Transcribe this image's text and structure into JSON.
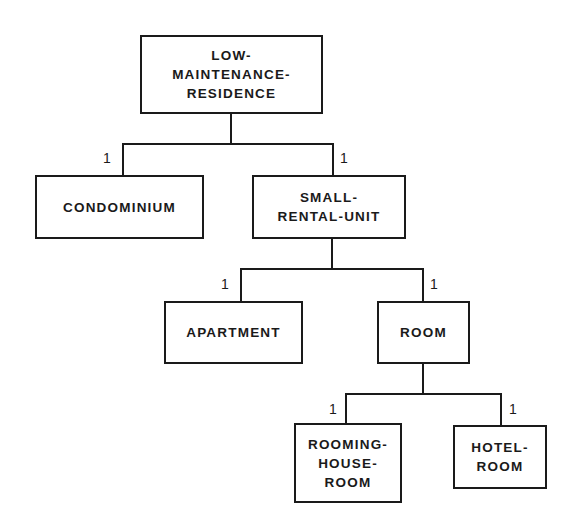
{
  "diagram": {
    "type": "generalization hierarchy",
    "nodes": [
      {
        "id": "low-maintenance-residence",
        "label": "LOW-\nMAINTENANCE-\nRESIDENCE"
      },
      {
        "id": "condominium",
        "label": "CONDOMINIUM"
      },
      {
        "id": "small-rental-unit",
        "label": "SMALL-\nRENTAL-UNIT"
      },
      {
        "id": "apartment",
        "label": "APARTMENT"
      },
      {
        "id": "room",
        "label": "ROOM"
      },
      {
        "id": "rooming-house-room",
        "label": "ROOMING-\nHOUSE-\nROOM"
      },
      {
        "id": "hotel-room",
        "label": "HOTEL-\nROOM"
      }
    ],
    "edges": [
      {
        "from": "low-maintenance-residence",
        "to": "condominium",
        "cardinality": "1"
      },
      {
        "from": "low-maintenance-residence",
        "to": "small-rental-unit",
        "cardinality": "1"
      },
      {
        "from": "small-rental-unit",
        "to": "apartment",
        "cardinality": "1"
      },
      {
        "from": "small-rental-unit",
        "to": "room",
        "cardinality": "1"
      },
      {
        "from": "room",
        "to": "rooming-house-room",
        "cardinality": "1"
      },
      {
        "from": "room",
        "to": "hotel-room",
        "cardinality": "1"
      }
    ]
  }
}
